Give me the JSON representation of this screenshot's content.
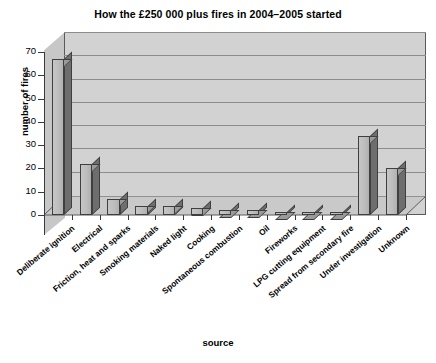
{
  "chart_data": {
    "type": "bar",
    "title": "How the £250 000 plus fires in 2004–2005 started",
    "xlabel": "source",
    "ylabel": "number of fires",
    "ylim": [
      0,
      70
    ],
    "ytick_step": 10,
    "yticks": [
      "0",
      "10",
      "20",
      "30",
      "40",
      "50",
      "60",
      "70"
    ],
    "grid": true,
    "legend": "none",
    "style": "3d-column",
    "categories": [
      "Deliberate ignition",
      "Electrical",
      "Friction, heat and sparks",
      "Smoking materials",
      "Naked light",
      "Cooking",
      "Spontaneous combustion",
      "Oil",
      "Fireworks",
      "LPG cutting equipment",
      "Spread from secondary fire",
      "Under investigation",
      "Unknown"
    ],
    "values": [
      67,
      22,
      7,
      4,
      4,
      3,
      2,
      2,
      1,
      1,
      1,
      34,
      20
    ]
  },
  "colors": {
    "bar_front": "#bdbdbd",
    "bar_side": "#6e6e6e",
    "bar_top": "#9a9a9a",
    "plot_background": "#d2d2d2",
    "gridline": "#8d8d8d",
    "axis": "#3a3a3a",
    "text": "#000000",
    "page_background": "#ffffff"
  }
}
